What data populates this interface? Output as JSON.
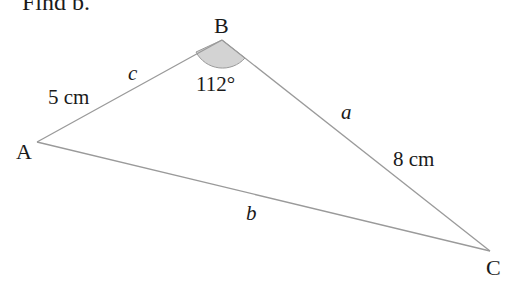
{
  "prompt": "Find b.",
  "vertices": {
    "A": {
      "label": "A",
      "x": 37,
      "y": 142
    },
    "B": {
      "label": "B",
      "x": 222,
      "y": 40
    },
    "C": {
      "label": "C",
      "x": 490,
      "y": 251
    }
  },
  "sides": {
    "c": {
      "label": "c",
      "length_label": "5 cm"
    },
    "a": {
      "label": "a",
      "length_label": "8 cm"
    },
    "b": {
      "label": "b"
    }
  },
  "angle_B": {
    "label": "112°",
    "fill": "#d3d3d3"
  },
  "colors": {
    "line": "#9a9a9a",
    "text": "#1a1a1a",
    "angle_fill": "#d3d3d3"
  }
}
